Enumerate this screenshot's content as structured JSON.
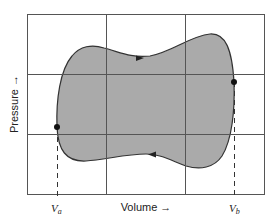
{
  "figure": {
    "type": "pv-diagram",
    "x_axis_label": "Volume →",
    "y_axis_label": "Pressure →",
    "points": [
      {
        "name": "a",
        "label_main": "V",
        "label_sub": "a"
      },
      {
        "name": "b",
        "label_main": "V",
        "label_sub": "b"
      }
    ],
    "cycle_direction": "clockwise",
    "grid": {
      "rows": 3,
      "cols": 3
    },
    "colors": {
      "fill": "#a9a9a9",
      "line": "#333333",
      "grid": "#555555"
    }
  }
}
